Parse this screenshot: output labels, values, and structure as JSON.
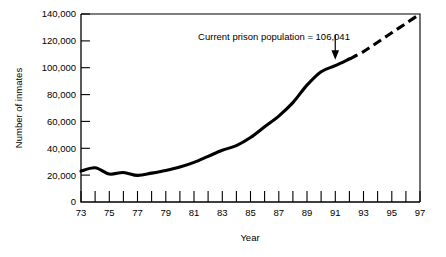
{
  "chart_data": {
    "type": "line",
    "title": "",
    "xlabel": "Year",
    "ylabel": "Number of inmates",
    "xlim": [
      73,
      97
    ],
    "ylim": [
      0,
      140000
    ],
    "grid": false,
    "legend": null,
    "x_tick_labels": [
      "73",
      "75",
      "77",
      "79",
      "81",
      "83",
      "85",
      "87",
      "89",
      "91",
      "93",
      "95",
      "97"
    ],
    "x_tick_values": [
      73,
      75,
      77,
      79,
      81,
      83,
      85,
      87,
      89,
      91,
      93,
      95,
      97
    ],
    "x_minor_ticks": [
      74,
      76,
      78,
      80,
      82,
      84,
      86,
      88,
      90,
      92,
      94,
      96
    ],
    "y_tick_labels": [
      "0",
      "20,000",
      "40,000",
      "60,000",
      "80,000",
      "100,000",
      "120,000",
      "140,000"
    ],
    "y_tick_values": [
      0,
      20000,
      40000,
      60000,
      80000,
      100000,
      120000,
      140000
    ],
    "series": [
      {
        "name": "Actual prison population",
        "style": "solid",
        "x": [
          73,
          74,
          75,
          76,
          77,
          78,
          79,
          80,
          81,
          82,
          83,
          84,
          85,
          86,
          87,
          88,
          89,
          90,
          91,
          92
        ],
        "values": [
          23000,
          25500,
          20800,
          22000,
          19800,
          21500,
          23500,
          26000,
          29500,
          34000,
          38500,
          42000,
          48000,
          56000,
          64000,
          74000,
          87000,
          97000,
          101500,
          106500
        ]
      },
      {
        "name": "Projected prison population",
        "style": "dashed",
        "x": [
          92,
          93,
          94,
          95,
          96,
          97
        ],
        "values": [
          106500,
          112000,
          119000,
          126000,
          133000,
          140000
        ]
      }
    ],
    "annotations": [
      {
        "text": "Current prison population = 106,041",
        "value": 106041,
        "points_to_x": 91,
        "points_to_y": 101500,
        "arrow": "down-arrow"
      }
    ]
  }
}
